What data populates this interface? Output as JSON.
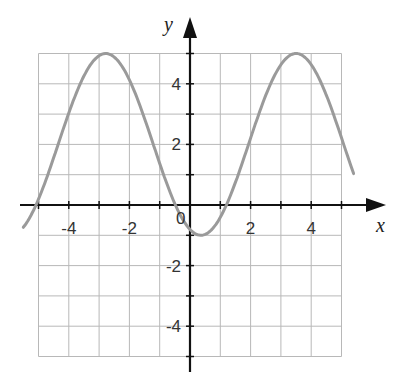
{
  "chart_data": {
    "type": "line",
    "title": "",
    "xlabel": "x",
    "ylabel": "y",
    "xlim": [
      -5.5,
      6.5
    ],
    "ylim": [
      -5.5,
      6.2
    ],
    "grid": true,
    "grid_range": {
      "x": [
        -5,
        5
      ],
      "y": [
        -5,
        5
      ],
      "step": 1
    },
    "x_ticks": [
      -5,
      -4,
      -3,
      -2,
      -1,
      1,
      2,
      3,
      4,
      5
    ],
    "y_ticks": [
      -5,
      -4,
      -3,
      -2,
      -1,
      1,
      2,
      3,
      4,
      5
    ],
    "x_tick_labels": [
      "-4",
      "-2",
      "0",
      "2",
      "4"
    ],
    "y_tick_labels": [
      "4",
      "2",
      "-2",
      "-4"
    ],
    "origin_label": "0",
    "series": [
      {
        "name": "curve",
        "function": "y = 2 - 3cos(x - 0.36)",
        "color": "#9a9a9a",
        "x_range": [
          -5.5,
          5.4
        ],
        "key_points": [
          {
            "x": -2.78,
            "y": 5,
            "note": "maximum"
          },
          {
            "x": 0.36,
            "y": -1,
            "note": "minimum"
          },
          {
            "x": 3.5,
            "y": 5,
            "note": "maximum"
          },
          {
            "x": -0.48,
            "y": 0,
            "note": "x-intercept"
          },
          {
            "x": 1.2,
            "y": 0,
            "note": "x-intercept"
          },
          {
            "x": -5.13,
            "y": 0,
            "note": "x-intercept"
          }
        ],
        "amplitude": 3,
        "midline": 2,
        "period": 6.28
      }
    ]
  },
  "labels": {
    "x_axis": "x",
    "y_axis": "y",
    "origin": "0",
    "x_ticks": [
      {
        "value": -4,
        "text": "-4"
      },
      {
        "value": -2,
        "text": "-2"
      },
      {
        "value": 2,
        "text": "2"
      },
      {
        "value": 4,
        "text": "4"
      }
    ],
    "y_ticks": [
      {
        "value": 4,
        "text": "4"
      },
      {
        "value": 2,
        "text": "2"
      },
      {
        "value": -2,
        "text": "-2"
      },
      {
        "value": -4,
        "text": "-4"
      }
    ]
  }
}
